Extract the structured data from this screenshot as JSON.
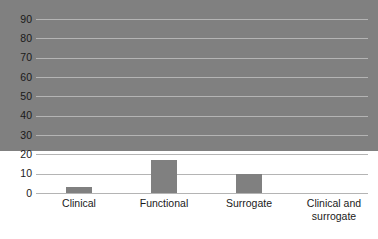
{
  "chart_data": {
    "type": "bar",
    "title": "",
    "xlabel": "",
    "ylabel": "",
    "categories": [
      "Clinical",
      "Functional",
      "Surrogate",
      "Clinical and surrogate"
    ],
    "values": [
      78,
      3,
      17,
      10
    ],
    "ylim": [
      0,
      90
    ],
    "ytick_labels": [
      "90",
      "80",
      "70",
      "60",
      "50",
      "40",
      "30",
      "20",
      "10",
      "0"
    ],
    "ytick_values": [
      90,
      80,
      70,
      60,
      50,
      40,
      30,
      20,
      10,
      0
    ],
    "grid": true,
    "legend": false,
    "bar_color": "#808080",
    "gridline_color": "#b4b4b4",
    "background_color": "#ffffff"
  },
  "labels": {
    "cat0": "Clinical",
    "cat1": "Functional",
    "cat2": "Surrogate",
    "cat3_line1": "Clinical and",
    "cat3_line2": "surrogate"
  },
  "yticks": {
    "t90": "90",
    "t80": "80",
    "t70": "70",
    "t60": "60",
    "t50": "50",
    "t40": "40",
    "t30": "30",
    "t20": "20",
    "t10": "10",
    "t0": "0"
  }
}
